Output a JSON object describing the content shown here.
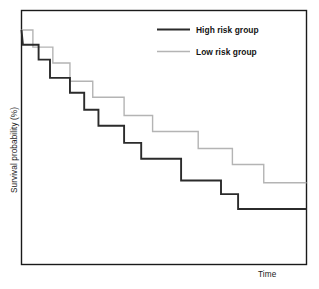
{
  "chart_data": {
    "type": "line",
    "subtype": "kaplan-meier-step",
    "title": "",
    "xlabel": "Time",
    "ylabel": "Survival probability (%)",
    "grid": false,
    "axis_ticks": false,
    "legend_position": "top-right-inside",
    "xlim": [
      0,
      100
    ],
    "ylim": [
      0,
      100
    ],
    "series": [
      {
        "name": "High risk group",
        "color": "#2b2b2b",
        "line_width": 1.9,
        "steps_x": [
          0,
          0.5,
          6,
          10,
          17,
          22,
          27,
          36,
          42,
          50,
          56,
          76,
          80,
          87,
          92,
          100
        ],
        "steps_y": [
          100,
          93.5,
          93.5,
          87.0,
          87.0,
          79.0,
          79.0,
          72.5,
          72.5,
          65.0,
          65.0,
          56.0,
          56.0,
          50.5,
          50.5,
          50.5
        ],
        "points": [
          {
            "x": 0,
            "y": 100.0
          },
          {
            "x": 0.5,
            "y": 93.5
          },
          {
            "x": 6,
            "y": 93.5
          },
          {
            "x": 6,
            "y": 87.0
          },
          {
            "x": 10,
            "y": 87.0
          },
          {
            "x": 10,
            "y": 79.0
          },
          {
            "x": 17,
            "y": 79.0
          },
          {
            "x": 17,
            "y": 72.5
          },
          {
            "x": 22,
            "y": 72.5
          },
          {
            "x": 22,
            "y": 65.0
          },
          {
            "x": 27,
            "y": 65.0
          },
          {
            "x": 27,
            "y": 58.0
          },
          {
            "x": 36,
            "y": 58.0
          },
          {
            "x": 36,
            "y": 50.5
          },
          {
            "x": 42,
            "y": 50.5
          },
          {
            "x": 42,
            "y": 43.5
          },
          {
            "x": 56,
            "y": 43.5
          },
          {
            "x": 56,
            "y": 34.0
          },
          {
            "x": 70,
            "y": 34.0
          },
          {
            "x": 70,
            "y": 28.0
          },
          {
            "x": 76,
            "y": 28.0
          },
          {
            "x": 76,
            "y": 21.5
          },
          {
            "x": 100,
            "y": 21.5
          }
        ]
      },
      {
        "name": "Low risk group",
        "color": "#b4b4b4",
        "line_width": 1.4,
        "points": [
          {
            "x": 0,
            "y": 100.0
          },
          {
            "x": 4,
            "y": 100.0
          },
          {
            "x": 4,
            "y": 92.5
          },
          {
            "x": 11,
            "y": 92.5
          },
          {
            "x": 11,
            "y": 85.5
          },
          {
            "x": 17,
            "y": 85.5
          },
          {
            "x": 17,
            "y": 77.5
          },
          {
            "x": 25,
            "y": 77.5
          },
          {
            "x": 25,
            "y": 70.5
          },
          {
            "x": 36,
            "y": 70.5
          },
          {
            "x": 36,
            "y": 62.5
          },
          {
            "x": 46,
            "y": 62.5
          },
          {
            "x": 46,
            "y": 55.5
          },
          {
            "x": 62,
            "y": 55.5
          },
          {
            "x": 62,
            "y": 48.0
          },
          {
            "x": 74,
            "y": 48.0
          },
          {
            "x": 74,
            "y": 41.0
          },
          {
            "x": 85,
            "y": 41.0
          },
          {
            "x": 85,
            "y": 33.0
          },
          {
            "x": 100,
            "y": 33.0
          }
        ]
      }
    ]
  },
  "legend": {
    "entries": [
      {
        "label": "High risk group",
        "color": "#2b2b2b"
      },
      {
        "label": "Low risk group",
        "color": "#b4b4b4"
      }
    ]
  },
  "axes": {
    "y_label": "Survival probability (%)",
    "x_label": "Time"
  },
  "colors": {
    "high_risk": "#2b2b2b",
    "low_risk": "#b4b4b4",
    "frame": "#1a1a1a",
    "background": "#ffffff"
  }
}
